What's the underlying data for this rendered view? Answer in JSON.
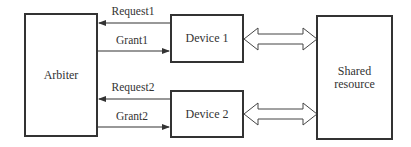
{
  "diagram": {
    "blocks": {
      "arbiter": {
        "label": "Arbiter"
      },
      "device1": {
        "label": "Device 1"
      },
      "device2": {
        "label": "Device 2"
      },
      "shared": {
        "label_line1": "Shared",
        "label_line2": "resource"
      }
    },
    "signals": {
      "request1": {
        "label": "Request1",
        "direction": "device1-to-arbiter"
      },
      "grant1": {
        "label": "Grant1",
        "direction": "arbiter-to-device1"
      },
      "request2": {
        "label": "Request2",
        "direction": "device2-to-arbiter"
      },
      "grant2": {
        "label": "Grant2",
        "direction": "arbiter-to-device2"
      }
    },
    "buses": [
      {
        "from": "Device 1",
        "to": "Shared resource",
        "type": "bidirectional"
      },
      {
        "from": "Device 2",
        "to": "Shared resource",
        "type": "bidirectional"
      }
    ],
    "colors": {
      "stroke": "#333333",
      "background": "#ffffff"
    }
  }
}
